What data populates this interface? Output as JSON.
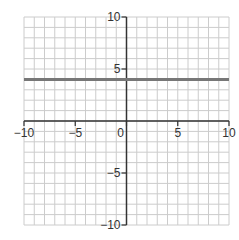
{
  "chart_data": {
    "type": "line",
    "title": "",
    "xlabel": "",
    "ylabel": "",
    "xlim": [
      -10,
      10
    ],
    "ylim": [
      -10,
      10
    ],
    "grid": true,
    "grid_step": 1,
    "x_ticks": [
      -10,
      -5,
      0,
      5,
      10
    ],
    "y_ticks": [
      -10,
      -5,
      5,
      10
    ],
    "x_tick_labels": [
      "−10",
      "−5",
      "0",
      "5",
      "10"
    ],
    "y_tick_labels": [
      "−10",
      "−5",
      "5",
      "10"
    ],
    "series": [
      {
        "name": "y = 4",
        "equation": "y = 4",
        "x": [
          -10,
          10
        ],
        "y": [
          4,
          4
        ],
        "color": "#777777"
      }
    ]
  },
  "colors": {
    "grid": "#cccccc",
    "axis": "#333333",
    "line": "#777777",
    "background": "#ffffff"
  }
}
